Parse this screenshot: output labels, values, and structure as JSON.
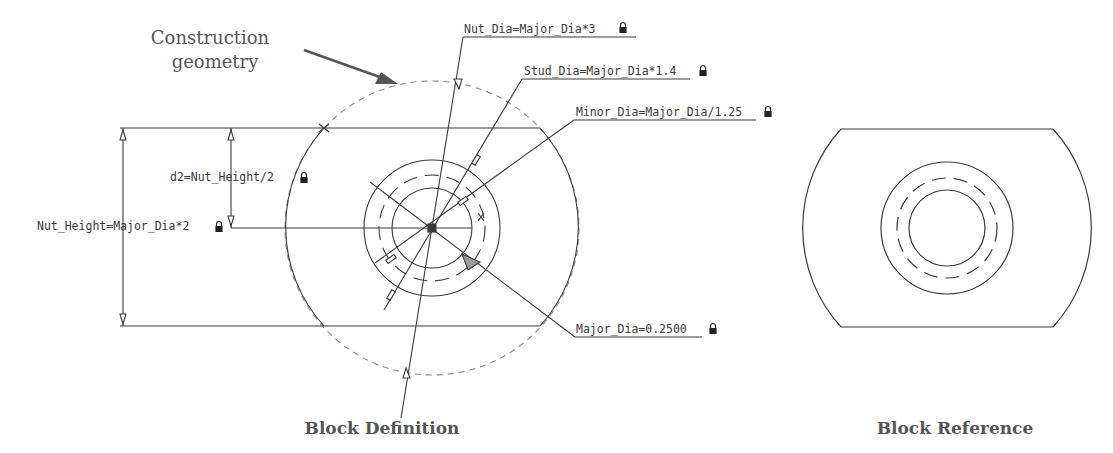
{
  "callout": {
    "line1": "Construction",
    "line2": "geometry"
  },
  "parameters": {
    "nut_dia": "Nut_Dia=Major_Dia*3",
    "stud_dia": "Stud_Dia=Major_Dia*1.4",
    "minor_dia": "Minor_Dia=Major_Dia/1.25",
    "d2": "d2=Nut_Height/2",
    "nut_height": "Nut_Height=Major_Dia*2",
    "major_dia": "Major_Dia=0.2500"
  },
  "captions": {
    "definition": "Block Definition",
    "reference": "Block Reference"
  },
  "icons": {
    "lock": "lock-icon"
  },
  "colors": {
    "line": "#3a3a3a",
    "construction": "#888888",
    "caption": "#555555"
  }
}
